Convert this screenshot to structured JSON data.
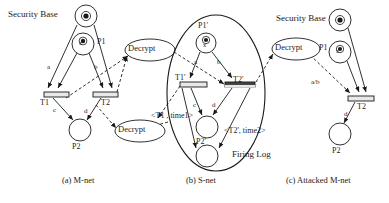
{
  "figure": {
    "captions": [
      {
        "id": "cap-a",
        "text": "(a) M-net",
        "x": 62,
        "y": 176
      },
      {
        "id": "cap-b",
        "text": "(b) S-net",
        "x": 186,
        "y": 176
      },
      {
        "id": "cap-c",
        "text": "(c) Attacked M-net",
        "x": 286,
        "y": 176
      }
    ]
  },
  "panel_a": {
    "security_base_label": "Security Base",
    "places": [
      {
        "name": "security-base-place",
        "label": "",
        "cx": 86,
        "cy": 16,
        "r": 11,
        "token": true
      },
      {
        "name": "p1-place",
        "label": "P1",
        "cx": 83,
        "cy": 44,
        "r": 11,
        "token": true,
        "inner": "x"
      },
      {
        "name": "p2-place",
        "label": "P2",
        "cx": 80,
        "cy": 130,
        "r": 11,
        "token": false
      }
    ],
    "transitions": [
      {
        "name": "t1-transition",
        "label": "T1",
        "x": 44,
        "y": 92,
        "w": 25,
        "h": 5
      },
      {
        "name": "t2-transition",
        "label": "T2",
        "x": 93,
        "y": 92,
        "w": 25,
        "h": 5
      }
    ],
    "arc_labels": [
      {
        "text": "a",
        "x": 49,
        "y": 70
      },
      {
        "text": "b",
        "x": 95,
        "y": 70
      },
      {
        "text": "c",
        "x": 55,
        "y": 112
      },
      {
        "text": "d",
        "x": 85,
        "y": 113
      }
    ],
    "decrypt_top": {
      "label": "Decrypt",
      "cx": 150,
      "cy": 50,
      "rx": 25,
      "ry": 11
    },
    "decrypt_bottom": {
      "label": "Decrypt",
      "cx": 140,
      "cy": 131,
      "rx": 25,
      "ry": 11
    }
  },
  "panel_b": {
    "firing_log_label": "Firing Log",
    "places": [
      {
        "name": "p1-prime-place",
        "label": "P1'",
        "cx": 206,
        "cy": 43,
        "r": 10,
        "token": true,
        "inner": "x"
      },
      {
        "name": "p2-prime-place",
        "label": "P2'",
        "cx": 207,
        "cy": 127,
        "r": 11,
        "token": false
      },
      {
        "name": "log-place",
        "label": "",
        "cx": 207,
        "cy": 156,
        "r": 11,
        "token": false
      }
    ],
    "transitions": [
      {
        "name": "t1-prime-transition",
        "label": "T1'",
        "x": 180,
        "y": 82,
        "w": 27,
        "h": 5
      },
      {
        "name": "t2-prime-transition",
        "label": "T2'",
        "x": 225,
        "y": 82,
        "w": 30,
        "h": 5
      }
    ],
    "arc_labels": [
      {
        "text": "a",
        "x": 197,
        "y": 65
      },
      {
        "text": "b",
        "x": 219,
        "y": 65
      },
      {
        "text": "c",
        "x": 195,
        "y": 108
      },
      {
        "text": "d",
        "x": 214,
        "y": 108
      }
    ],
    "log_entries": [
      {
        "text": "<T1 , time1>",
        "x": 155,
        "y": 116
      },
      {
        "text": "<T2', time2>",
        "x": 227,
        "y": 131
      }
    ]
  },
  "panel_c": {
    "security_base_label": "Security Base",
    "places": [
      {
        "name": "security-base-place",
        "label": "",
        "cx": 340,
        "cy": 20,
        "r": 11,
        "token": true
      },
      {
        "name": "p1-place",
        "label": "P1",
        "cx": 340,
        "cy": 52,
        "r": 11,
        "token": true,
        "inner": "x"
      },
      {
        "name": "p2-place",
        "label": "P2",
        "cx": 340,
        "cy": 134,
        "r": 11,
        "token": false
      }
    ],
    "transitions": [
      {
        "name": "t2-transition",
        "label": "T2",
        "x": 348,
        "y": 96,
        "w": 26,
        "h": 5
      }
    ],
    "arc_labels": [
      {
        "text": "a/b",
        "x": 316,
        "y": 85
      },
      {
        "text": "d",
        "x": 346,
        "y": 117
      }
    ],
    "decrypt": {
      "label": "Decrypt",
      "cx": 296,
      "cy": 49,
      "rx": 24,
      "ry": 11
    }
  },
  "colors": {
    "ink": "#1a1a1a",
    "paper": "#ffffff"
  }
}
